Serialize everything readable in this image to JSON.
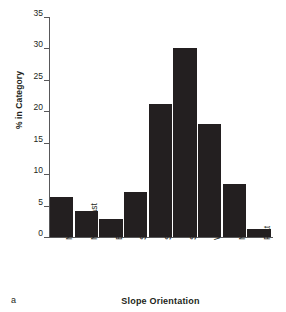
{
  "panel": {
    "label": "a"
  },
  "chart_data": {
    "type": "bar",
    "title": "",
    "xlabel": "Slope Orientation",
    "ylabel": "% in Category",
    "categories": [
      "North",
      "Northeast",
      "East",
      "Southeast",
      "South",
      "Southwest",
      "West",
      "Northwest",
      "Flat"
    ],
    "values": [
      6.3,
      4.2,
      2.8,
      7.1,
      21.1,
      30.1,
      18.0,
      8.4,
      1.3
    ],
    "ylim": [
      0,
      35
    ],
    "yticks": [
      0,
      5,
      10,
      15,
      20,
      25,
      30,
      35
    ],
    "ytick_labels": [
      "0",
      "5",
      "10",
      "15",
      "20",
      "25",
      "30",
      "35"
    ],
    "grid": false,
    "legend": false,
    "bar_color": "#231f20",
    "axis_color": "#58585a",
    "background": "#ffffff"
  }
}
